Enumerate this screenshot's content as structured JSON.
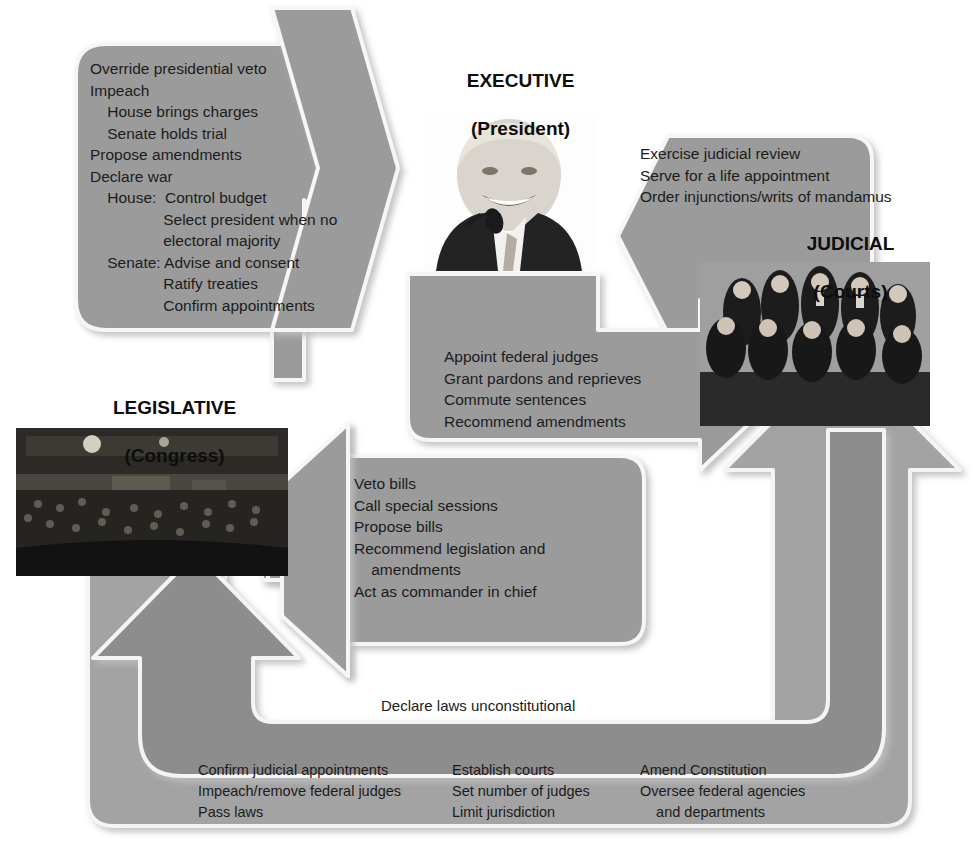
{
  "diagram": {
    "colors": {
      "arrow_fill": "#9b9b9b",
      "arrow_fill_dark": "#8d8d8d",
      "arrow_fill_outer": "#a3a3a3",
      "arrow_edge_light": "#f2f2f2",
      "arrow_shadow": "#c9c9c9",
      "text": "#1b1b1b",
      "background": "#ffffff"
    }
  },
  "branches": {
    "executive": {
      "title": "EXECUTIVE",
      "subtitle": "(President)",
      "photo_alt": "president-photo"
    },
    "legislative": {
      "title": "LEGISLATIVE",
      "subtitle": "(Congress)",
      "photo_alt": "congress-chamber-photo"
    },
    "judicial": {
      "title": "JUDICIAL",
      "subtitle": "(Courts)",
      "photo_alt": "supreme-court-justices-photo"
    }
  },
  "arrows": {
    "legislative_over_executive": {
      "name": "legislative-checks-on-executive",
      "lines": [
        "Override presidential veto",
        "Impeach",
        "    House brings charges",
        "    Senate holds trial",
        "Propose amendments",
        "Declare war",
        "    House:  Control budget",
        "                 Select president when no",
        "                 electoral majority",
        "    Senate: Advise and consent",
        "                 Ratify treaties",
        "                 Confirm appointments"
      ]
    },
    "judicial_over_executive": {
      "name": "judicial-checks-on-executive",
      "lines": [
        "Exercise judicial review",
        "Serve for a life appointment",
        "Order injunctions/writs of mandamus"
      ]
    },
    "executive_over_judicial": {
      "name": "executive-checks-on-judicial",
      "lines": [
        "Appoint federal judges",
        "Grant pardons and reprieves",
        "Commute sentences",
        "Recommend amendments"
      ]
    },
    "executive_over_legislative": {
      "name": "executive-checks-on-legislative",
      "lines": [
        "Veto bills",
        "Call special sessions",
        "Propose bills",
        "Recommend legislation and",
        "    amendments",
        "Act as commander in chief"
      ]
    },
    "judicial_over_legislative": {
      "name": "judicial-checks-on-legislative",
      "lines": [
        "Declare laws unconstitutional"
      ]
    },
    "legislative_over_judicial": {
      "name": "legislative-checks-on-judicial",
      "columns": [
        [
          "Confirm judicial appointments",
          "Impeach/remove federal judges",
          "Pass laws"
        ],
        [
          "Establish courts",
          "Set number of judges",
          "Limit jurisdiction"
        ],
        [
          "Amend Constitution",
          "Oversee federal agencies",
          "    and departments"
        ]
      ]
    }
  }
}
